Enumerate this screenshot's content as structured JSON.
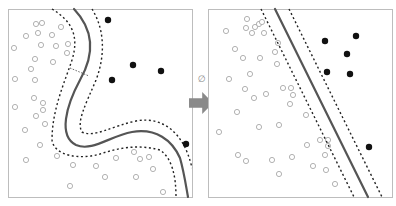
{
  "diagram": {
    "transform_symbol": "∅",
    "colors": {
      "frame": "#bdbdbd",
      "hollow_stroke": "#a9a9a9",
      "filled": "#111111",
      "boundary": "#555555",
      "margin": "#222222",
      "arrow": "#8a8a8a"
    },
    "left_panel": {
      "name": "input-space",
      "frame": {
        "x": 8,
        "y": 9,
        "w": 184,
        "h": 188
      },
      "boundary_path": "M74,9 C92,28 96,52 80,80 C66,106 58,136 76,145 C92,152 110,136 132,132 C156,128 172,140 180,158 C184,172 186,186 188,197",
      "margin_paths": [
        "M52,9 C70,20 80,34 72,60 C64,84 52,110 52,140 C54,156 80,160 100,154 C118,148 138,144 160,150 C172,158 176,176 176,197",
        "M92,9 C104,28 106,54 96,80 C86,104 76,122 82,132 C94,138 112,126 136,121 C162,116 184,132 192,168"
      ],
      "margin_connector": {
        "x1": 70,
        "y1": 68,
        "x2": 89,
        "y2": 76
      },
      "hollow_points": [
        [
          36,
          24
        ],
        [
          42,
          23
        ],
        [
          26,
          36
        ],
        [
          38,
          33
        ],
        [
          52,
          35
        ],
        [
          61,
          27
        ],
        [
          14,
          48
        ],
        [
          41,
          45
        ],
        [
          56,
          46
        ],
        [
          68,
          44
        ],
        [
          67,
          53
        ],
        [
          35,
          59
        ],
        [
          53,
          62
        ],
        [
          31,
          69
        ],
        [
          15,
          79
        ],
        [
          35,
          80
        ],
        [
          34,
          98
        ],
        [
          43,
          103
        ],
        [
          43,
          110
        ],
        [
          15,
          107
        ],
        [
          36,
          116
        ],
        [
          45,
          124
        ],
        [
          25,
          130
        ],
        [
          40,
          145
        ],
        [
          26,
          160
        ],
        [
          57,
          156
        ],
        [
          73,
          165
        ],
        [
          96,
          166
        ],
        [
          116,
          158
        ],
        [
          105,
          177
        ],
        [
          70,
          186
        ],
        [
          134,
          152
        ],
        [
          140,
          159
        ],
        [
          149,
          157
        ],
        [
          153,
          169
        ],
        [
          136,
          177
        ],
        [
          163,
          192
        ]
      ],
      "filled_points": [
        [
          108,
          20
        ],
        [
          133,
          65
        ],
        [
          161,
          71
        ],
        [
          112,
          80
        ],
        [
          186,
          144
        ]
      ]
    },
    "arrow": {
      "x": 189,
      "y": 92,
      "w": 24,
      "h": 22
    },
    "symbol_pos": {
      "x": 198,
      "y": 82
    },
    "right_panel": {
      "name": "feature-space",
      "frame": {
        "x": 208,
        "y": 9,
        "w": 184,
        "h": 188
      },
      "boundary_line": {
        "x1": 275,
        "y1": 9,
        "x2": 368,
        "y2": 197
      },
      "margin_lines": [
        {
          "x1": 261,
          "y1": 9,
          "x2": 354,
          "y2": 197
        },
        {
          "x1": 289,
          "y1": 9,
          "x2": 382,
          "y2": 197
        }
      ],
      "hollow_points": [
        [
          247,
          19
        ],
        [
          255,
          27
        ],
        [
          259,
          24
        ],
        [
          262,
          22
        ],
        [
          246,
          28
        ],
        [
          252,
          33
        ],
        [
          226,
          31
        ],
        [
          264,
          33
        ],
        [
          235,
          49
        ],
        [
          278,
          43
        ],
        [
          275,
          52
        ],
        [
          243,
          58
        ],
        [
          260,
          58
        ],
        [
          277,
          64
        ],
        [
          250,
          74
        ],
        [
          229,
          79
        ],
        [
          245,
          89
        ],
        [
          283,
          88
        ],
        [
          291,
          88
        ],
        [
          293,
          95
        ],
        [
          254,
          98
        ],
        [
          266,
          94
        ],
        [
          237,
          112
        ],
        [
          290,
          104
        ],
        [
          306,
          115
        ],
        [
          259,
          127
        ],
        [
          279,
          125
        ],
        [
          219,
          132
        ],
        [
          320,
          140
        ],
        [
          328,
          140
        ],
        [
          328,
          146
        ],
        [
          307,
          145
        ],
        [
          325,
          155
        ],
        [
          238,
          155
        ],
        [
          272,
          160
        ],
        [
          292,
          157
        ],
        [
          246,
          161
        ],
        [
          313,
          166
        ],
        [
          326,
          170
        ],
        [
          279,
          174
        ],
        [
          335,
          184
        ]
      ],
      "filled_points": [
        [
          325,
          41
        ],
        [
          356,
          36
        ],
        [
          347,
          54
        ],
        [
          327,
          72
        ],
        [
          350,
          74
        ],
        [
          369,
          147
        ]
      ]
    }
  }
}
